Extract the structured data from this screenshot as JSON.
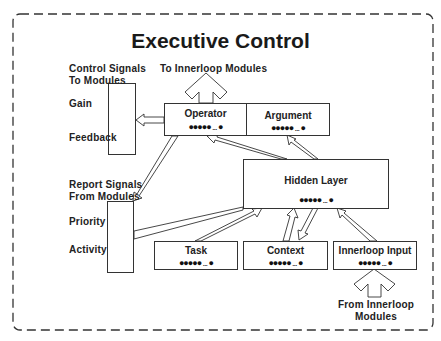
{
  "title": "Executive Control",
  "labels": {
    "control_signals_line1": "Control Signals",
    "control_signals_line2": "To Modules",
    "gain": "Gain",
    "feedback": "Feedback",
    "report_signals_line1": "Report Signals",
    "report_signals_line2": "From Modules",
    "priority": "Priority",
    "activity": "Activity",
    "to_innerloop": "To Innerloop Modules",
    "from_innerloop_line1": "From Innerloop",
    "from_innerloop_line2": "Modules"
  },
  "nodes": {
    "operator": {
      "label": "Operator",
      "units": "●●●●● ... ●"
    },
    "argument": {
      "label": "Argument",
      "units": "●●●●● ... ●"
    },
    "hidden_layer": {
      "label": "Hidden Layer",
      "units": "●●●●● ... ●"
    },
    "task": {
      "label": "Task",
      "units": "●●●●● ... ●"
    },
    "context": {
      "label": "Context",
      "units": "●●●●● ... ●"
    },
    "innerloop_input": {
      "label": "Innerloop Input",
      "units": "●●●●● ... ●"
    }
  },
  "edges": [
    {
      "from": "operator",
      "to": "control_signals_box"
    },
    {
      "from": "operator",
      "to": "innerloop_modules"
    },
    {
      "from": "operator",
      "to": "report_signals_box"
    },
    {
      "from": "hidden_layer",
      "to": "operator"
    },
    {
      "from": "hidden_layer",
      "to": "argument"
    },
    {
      "from": "report_signals_box",
      "to": "hidden_layer"
    },
    {
      "from": "task",
      "to": "hidden_layer"
    },
    {
      "from": "context",
      "to": "hidden_layer"
    },
    {
      "from": "hidden_layer",
      "to": "context"
    },
    {
      "from": "innerloop_input",
      "to": "hidden_layer"
    },
    {
      "from": "innerloop_modules",
      "to": "innerloop_input"
    }
  ]
}
